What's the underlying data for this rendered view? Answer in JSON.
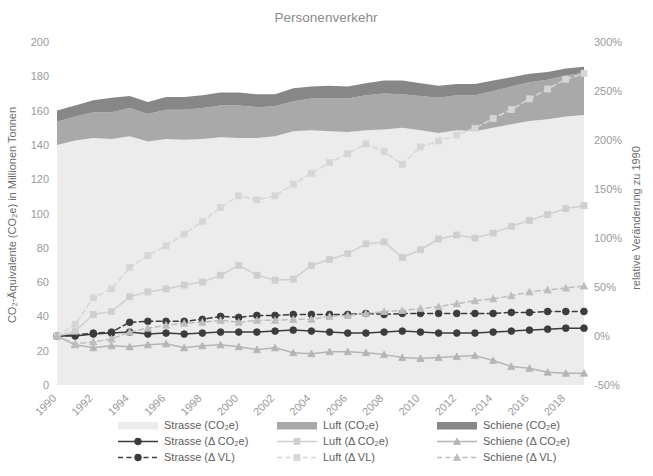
{
  "chart_data": {
    "type": "area",
    "title": "Personenverkehr",
    "xlabel": "",
    "ylabel": "CO₂-Äquivalente (CO₂e) in Millionen Tonnen",
    "y2label": "relative Veränderung zu 1990",
    "ylim": [
      0,
      200
    ],
    "yticks": [
      0,
      20,
      40,
      60,
      80,
      100,
      120,
      140,
      160,
      180,
      200
    ],
    "ytick_labels": [
      "0",
      "20",
      "40",
      "60",
      "80",
      "100",
      "120",
      "140",
      "160",
      "180",
      "200"
    ],
    "y2lim": [
      -50,
      300
    ],
    "y2ticks": [
      -50,
      0,
      50,
      100,
      150,
      200,
      250,
      300
    ],
    "y2tick_labels": [
      "-50%",
      "0%",
      "50%",
      "100%",
      "150%",
      "200%",
      "250%",
      "300%"
    ],
    "grid": false,
    "legend_position": "bottom",
    "x": [
      1990,
      1991,
      1992,
      1993,
      1994,
      1995,
      1996,
      1997,
      1998,
      1999,
      2000,
      2001,
      2002,
      2003,
      2004,
      2005,
      2006,
      2007,
      2008,
      2009,
      2010,
      2011,
      2012,
      2013,
      2014,
      2015,
      2016,
      2017,
      2018,
      2019
    ],
    "xtick_labels": [
      "1990",
      "1992",
      "1994",
      "1996",
      "1998",
      "2000",
      "2002",
      "2004",
      "2006",
      "2008",
      "2010",
      "2012",
      "2014",
      "2016",
      "2018"
    ],
    "xticks": [
      1990,
      1992,
      1994,
      1996,
      1998,
      2000,
      2002,
      2004,
      2006,
      2008,
      2010,
      2012,
      2014,
      2016,
      2018
    ],
    "stacked_areas": [
      {
        "name": "Strasse (CO₂e)",
        "color": "#ececec",
        "values": [
          140.0,
          142.5,
          144.0,
          143.5,
          145.0,
          142.0,
          143.5,
          143.0,
          143.5,
          144.5,
          144.0,
          144.0,
          145.0,
          148.0,
          148.5,
          148.0,
          147.5,
          148.5,
          149.0,
          150.0,
          148.5,
          147.0,
          148.5,
          148.0,
          150.0,
          152.0,
          154.0,
          155.0,
          156.5,
          157.5
        ]
      },
      {
        "name": "Luft (CO₂e)",
        "color": "#a9a9a9",
        "values": [
          13.5,
          14.0,
          15.0,
          15.5,
          16.5,
          16.0,
          17.0,
          17.5,
          18.0,
          18.5,
          19.0,
          18.0,
          17.5,
          17.5,
          18.5,
          19.0,
          19.5,
          20.5,
          21.0,
          19.5,
          20.0,
          20.5,
          20.5,
          21.0,
          21.5,
          22.0,
          22.5,
          23.0,
          24.0,
          24.5
        ]
      },
      {
        "name": "Schiene (CO₂e)",
        "color": "#878787",
        "values": [
          6.5,
          6.5,
          7.0,
          8.5,
          7.0,
          7.0,
          7.5,
          7.5,
          7.5,
          7.5,
          7.5,
          7.5,
          7.0,
          7.5,
          7.0,
          7.5,
          7.0,
          7.0,
          7.5,
          8.0,
          7.5,
          7.0,
          6.5,
          6.5,
          6.0,
          5.5,
          5.0,
          4.5,
          4.0,
          3.5
        ]
      }
    ],
    "relative_series": [
      {
        "name": "Strasse (Δ CO₂e)",
        "color": "#3c3c3c",
        "style": "solid",
        "marker": "circle",
        "axis": "right",
        "values": [
          0,
          0,
          2,
          3,
          4,
          2,
          3,
          2,
          3,
          4,
          4,
          4,
          5,
          6,
          5,
          4,
          3,
          3,
          4,
          5,
          4,
          3,
          3,
          3,
          4,
          5,
          6,
          7,
          8,
          8
        ]
      },
      {
        "name": "Strasse (Δ VL)",
        "color": "#3c3c3c",
        "style": "dashed",
        "marker": "circle",
        "axis": "right",
        "values": [
          0,
          1,
          3,
          4,
          14,
          15,
          15,
          15,
          17,
          20,
          19,
          21,
          21,
          22,
          22,
          22,
          22,
          23,
          22,
          23,
          23,
          23,
          23,
          23,
          23,
          24,
          24,
          25,
          25,
          25
        ]
      },
      {
        "name": "Luft (Δ CO₂e)",
        "color": "#cfcfcf",
        "style": "solid",
        "marker": "square",
        "axis": "right",
        "values": [
          0,
          5,
          22,
          25,
          40,
          45,
          48,
          52,
          55,
          62,
          72,
          62,
          57,
          58,
          72,
          78,
          84,
          94,
          96,
          80,
          88,
          99,
          103,
          100,
          105,
          112,
          118,
          124,
          130,
          133
        ]
      },
      {
        "name": "Luft (Δ VL)",
        "color": "#d6d6d6",
        "style": "dashed",
        "marker": "square",
        "axis": "right",
        "values": [
          0,
          12,
          39,
          48,
          70,
          82,
          92,
          104,
          117,
          131,
          143,
          139,
          143,
          155,
          166,
          177,
          186,
          196,
          188,
          175,
          193,
          199,
          205,
          212,
          222,
          231,
          242,
          252,
          262,
          268
        ]
      },
      {
        "name": "Schiene (Δ CO₂e)",
        "color": "#b5b5b5",
        "style": "solid",
        "marker": "triangle",
        "axis": "right",
        "values": [
          0,
          -9,
          -12,
          -10,
          -11,
          -9,
          -8,
          -12,
          -10,
          -9,
          -11,
          -14,
          -12,
          -17,
          -18,
          -16,
          -16,
          -17,
          -19,
          -22,
          -23,
          -22,
          -21,
          -20,
          -25,
          -31,
          -33,
          -37,
          -38,
          -38
        ]
      },
      {
        "name": "Schiene (Δ VL)",
        "color": "#bdbdbd",
        "style": "dashed",
        "marker": "triangle",
        "axis": "right",
        "values": [
          0,
          -8,
          -6,
          -3,
          4,
          8,
          11,
          13,
          14,
          16,
          14,
          16,
          16,
          17,
          17,
          20,
          21,
          23,
          25,
          26,
          28,
          30,
          33,
          36,
          38,
          41,
          45,
          47,
          49,
          51
        ]
      }
    ],
    "legend": [
      {
        "label": "Strasse (CO₂e)",
        "color": "#ececec",
        "kind": "patch"
      },
      {
        "label": "Strasse (Δ CO₂e)",
        "color": "#3c3c3c",
        "kind": "line",
        "style": "solid",
        "marker": "circle"
      },
      {
        "label": "Strasse (Δ VL)",
        "color": "#3c3c3c",
        "kind": "line",
        "style": "dashed",
        "marker": "circle"
      },
      {
        "label": "Luft  (CO₂e)",
        "color": "#a9a9a9",
        "kind": "patch"
      },
      {
        "label": "Luft  (Δ CO₂e)",
        "color": "#cfcfcf",
        "kind": "line",
        "style": "solid",
        "marker": "square"
      },
      {
        "label": "Luft (Δ VL)",
        "color": "#d6d6d6",
        "kind": "line",
        "style": "dashed",
        "marker": "square"
      },
      {
        "label": "Schiene (CO₂e)",
        "color": "#878787",
        "kind": "patch"
      },
      {
        "label": "Schiene  (Δ CO₂e)",
        "color": "#b5b5b5",
        "kind": "line",
        "style": "solid",
        "marker": "triangle"
      },
      {
        "label": "Schiene (Δ VL)",
        "color": "#bdbdbd",
        "kind": "line",
        "style": "dashed",
        "marker": "triangle"
      }
    ]
  }
}
